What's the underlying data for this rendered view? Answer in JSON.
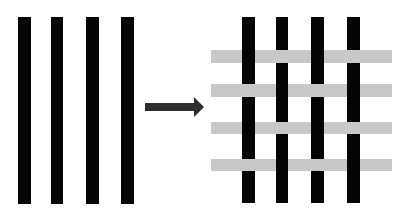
{
  "diagram": {
    "colors": {
      "background": "#ffffff",
      "warp": "#050505",
      "weft": "#c8c8c8",
      "arrow": "#2e2e2e"
    },
    "left_panel": {
      "label": "warp-strips",
      "strips": [
        {
          "x": 18,
          "w": 13
        },
        {
          "x": 51,
          "w": 12
        },
        {
          "x": 86,
          "w": 13
        },
        {
          "x": 121,
          "w": 13
        }
      ],
      "top": 17,
      "bottom": 204
    },
    "arrow": {
      "x1": 145,
      "x2": 204,
      "y": 107
    },
    "right_panel": {
      "label": "woven-grid",
      "warp": [
        {
          "x": 242,
          "w": 13,
          "over": [
            true,
            false,
            true,
            false
          ]
        },
        {
          "x": 276,
          "w": 12,
          "over": [
            false,
            true,
            false,
            true
          ]
        },
        {
          "x": 311,
          "w": 13,
          "over": [
            true,
            false,
            true,
            false
          ]
        },
        {
          "x": 347,
          "w": 13,
          "over": [
            false,
            true,
            false,
            true
          ]
        }
      ],
      "weft": [
        {
          "y": 50,
          "h": 13
        },
        {
          "y": 84,
          "h": 13
        },
        {
          "y": 122,
          "h": 12
        },
        {
          "y": 159,
          "h": 12
        }
      ],
      "weft_x1": 211,
      "weft_x2": 392,
      "top": 17,
      "bottom": 203
    }
  }
}
